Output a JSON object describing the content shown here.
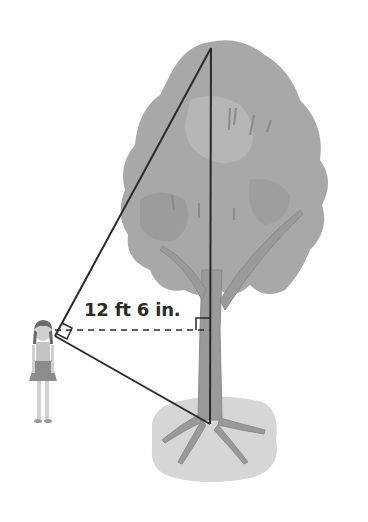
{
  "diagram": {
    "measurement_label": "12 ft 6 in.",
    "elements": [
      "girl",
      "tree",
      "triangle",
      "dashed-horizontal-line",
      "right-angle-marks"
    ],
    "colors": {
      "line": "#2a2a2a",
      "foliage": "#a8a8a8",
      "foliage_dark": "#8e8e8e",
      "trunk": "#9a9a9a",
      "ground": "#d6d6d6"
    }
  }
}
